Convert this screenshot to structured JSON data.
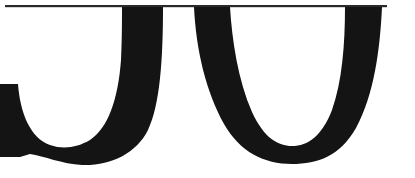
{
  "image": {
    "description": "Cropped close-up of large black serif letterforms showing the lower bowls of the letters 'J' and 'U' beneath a thin horizontal rule",
    "visible_letters": [
      "J",
      "U"
    ],
    "colors": {
      "background": "#ffffff",
      "ink": "#141414",
      "rule": "#2a2a2a"
    }
  }
}
